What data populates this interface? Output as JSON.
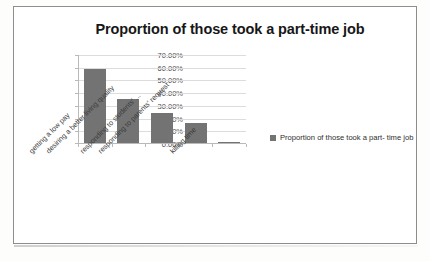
{
  "document": {
    "kind": "scanned-chart-figure"
  },
  "chart_data": {
    "type": "bar",
    "title": "Proportion of those took a part-time job",
    "xlabel": "",
    "ylabel": "",
    "grid": true,
    "legend_position": "right",
    "ylim": [
      0,
      70
    ],
    "ytick_labels": [
      "70.00%",
      "60.00%",
      "50.00%",
      "40.00%",
      "30.00%",
      "20.00%",
      "10.00%",
      "0.00%"
    ],
    "ytick_values": [
      70,
      60,
      50,
      40,
      30,
      20,
      10,
      0
    ],
    "categories": [
      "getting a low pay",
      "desiring a better living quality",
      "responding to students' ...",
      "responding to parents' request",
      "killing time"
    ],
    "values": [
      58.0,
      34.5,
      24.0,
      16.0,
      0.5
    ],
    "value_labels": [
      "58.00%",
      "34.50%",
      "24.00%",
      "16.00%",
      "0.50%"
    ],
    "series": [
      {
        "name": "Proportion of those took a part-time job",
        "color": "#737373",
        "values": [
          58.0,
          34.5,
          24.0,
          16.0,
          0.5
        ]
      }
    ],
    "legend": [
      {
        "label_line1": "Proportion of those took a part-",
        "label_line2": "time job",
        "color": "#737373"
      }
    ]
  },
  "colors": {
    "bar": "#737373",
    "grid": "#dcdcdc",
    "axis": "#b9b9b9",
    "title_text": "#171717",
    "tick_text": "#4a4a4a",
    "frame_border": "#8d8d8d"
  }
}
